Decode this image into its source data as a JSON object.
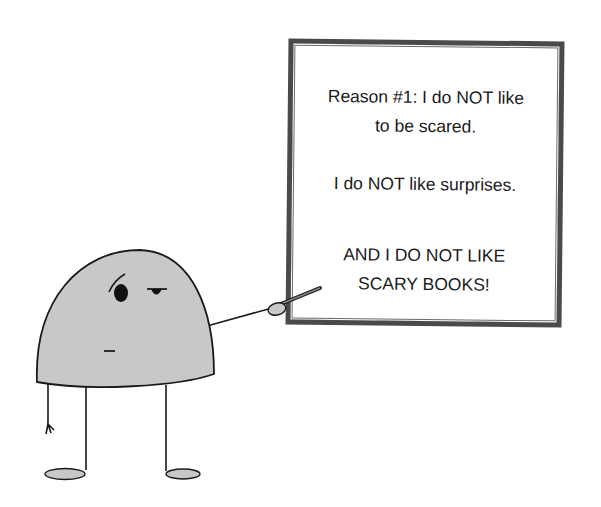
{
  "board": {
    "paragraphs": [
      {
        "lines": [
          "Reason #1: I do NOT like",
          "to be scared."
        ]
      },
      {
        "lines": [
          "I do NOT like surprises."
        ]
      },
      {
        "lines": [
          "AND I DO NOT LIKE",
          "SCARY BOOKS!"
        ]
      }
    ],
    "frame_color": "#4a4a4a"
  },
  "character": {
    "body_color": "#c8c8c8",
    "outline_color": "#1a1a1a",
    "expression": "skeptical",
    "holding": "pointer-stick"
  }
}
